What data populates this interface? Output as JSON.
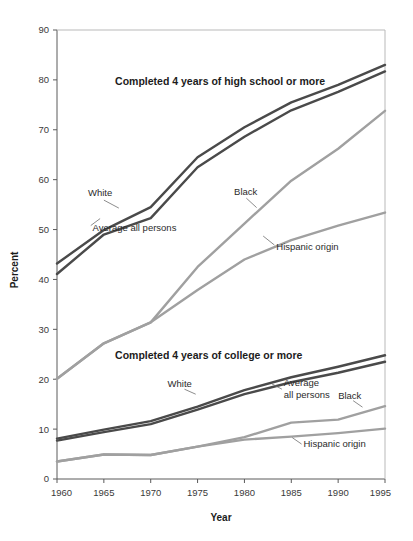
{
  "chart_data": {
    "type": "line",
    "title": "",
    "xlabel": "Year",
    "ylabel": "Percent",
    "x": [
      1960,
      1965,
      1970,
      1975,
      1980,
      1985,
      1990,
      1995
    ],
    "xlim": [
      1960,
      1995
    ],
    "ylim": [
      0,
      90
    ],
    "grid": false,
    "legend_position": "inline-annotations",
    "xticks": [
      "1960",
      "1965",
      "1970",
      "1975",
      "1980",
      "1985",
      "1990",
      "1995"
    ],
    "yticks": [
      "0",
      "10",
      "20",
      "30",
      "40",
      "50",
      "60",
      "70",
      "80",
      "90"
    ],
    "groups": [
      {
        "name": "high_school",
        "title": "Completed 4 years of high school or more",
        "title_x": 1966.2,
        "title_y": 79.0,
        "series": [
          {
            "name": "White",
            "color": "#4a4a4a",
            "width": 2.4,
            "values": [
              43.2,
              49.9,
              54.5,
              64.5,
              70.5,
              75.5,
              79.0,
              83.0
            ],
            "label": "White",
            "label_x": 1963.3,
            "label_y": 56.8,
            "leader": [
              [
                1965.0,
                55.9
              ],
              [
                1966.6,
                54.3
              ]
            ]
          },
          {
            "name": "Average all persons",
            "color": "#4a4a4a",
            "width": 2.4,
            "values": [
              41.1,
              49.0,
              52.3,
              62.5,
              68.6,
              73.9,
              77.6,
              81.7
            ],
            "label": "Average all persons",
            "label_x": 1963.8,
            "label_y": 49.8,
            "leader": [
              [
                1963.6,
                50.8
              ],
              [
                1964.6,
                52.2
              ]
            ]
          },
          {
            "name": "Black",
            "color": "#a0a0a0",
            "width": 2.4,
            "values": [
              20.1,
              27.2,
              31.4,
              42.5,
              51.2,
              59.8,
              66.2,
              73.8
            ],
            "label": "Black",
            "label_x": 1978.9,
            "label_y": 57.0,
            "leader": [
              [
                1980.2,
                56.3
              ],
              [
                1981.3,
                54.4
              ]
            ]
          },
          {
            "name": "Hispanic origin",
            "color": "#a0a0a0",
            "width": 2.4,
            "values": [
              20.1,
              27.2,
              31.4,
              37.9,
              44.0,
              47.9,
              50.8,
              53.4
            ],
            "label": "Hispanic origin",
            "label_x": 1983.4,
            "label_y": 46.0,
            "leader": [
              [
                1983.2,
                46.9
              ],
              [
                1982.0,
                48.7
              ]
            ]
          }
        ]
      },
      {
        "name": "college",
        "title": "Completed 4 years of college or more",
        "title_x": 1966.2,
        "title_y": 24.1,
        "series": [
          {
            "name": "White",
            "color": "#4a4a4a",
            "width": 2.4,
            "values": [
              8.1,
              9.9,
              11.6,
              14.5,
              17.8,
              20.4,
              22.5,
              24.8
            ],
            "label": "White",
            "label_x": 1971.8,
            "label_y": 18.4,
            "leader": [
              [
                1973.6,
                18.0
              ],
              [
                1974.8,
                17.0
              ]
            ]
          },
          {
            "name": "Average all persons",
            "color": "#4a4a4a",
            "width": 2.4,
            "values": [
              7.7,
              9.4,
              11.0,
              13.9,
              17.0,
              19.4,
              21.3,
              23.5
            ],
            "label": "Average\nall persons",
            "label_x": 1984.2,
            "label_y": 18.6,
            "leader": [
              [
                1984.0,
                18.0
              ],
              [
                1982.9,
                19.1
              ]
            ]
          },
          {
            "name": "Black",
            "color": "#a0a0a0",
            "width": 2.4,
            "values": [
              3.5,
              4.9,
              4.8,
              6.5,
              8.4,
              11.3,
              11.9,
              14.6
            ],
            "label": "Black",
            "label_x": 1990.0,
            "label_y": 16.1,
            "leader": [
              [
                1991.6,
                15.7
              ],
              [
                1992.6,
                14.4
              ]
            ]
          },
          {
            "name": "Hispanic origin",
            "color": "#a0a0a0",
            "width": 2.4,
            "values": [
              3.5,
              4.9,
              4.8,
              6.5,
              7.9,
              8.5,
              9.2,
              10.1
            ],
            "label": "Hispanic origin",
            "label_x": 1986.3,
            "label_y": 6.4,
            "leader": [
              [
                1986.1,
                7.0
              ],
              [
                1985.1,
                8.3
              ]
            ]
          }
        ]
      }
    ]
  }
}
